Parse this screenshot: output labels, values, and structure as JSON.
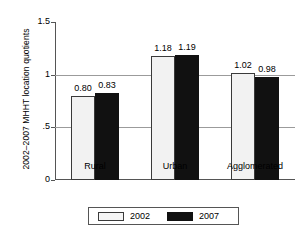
{
  "chart_data": {
    "type": "bar",
    "title": "",
    "xlabel": "",
    "ylabel": "2002–2007 MHHT  location quotients",
    "ylim": [
      0,
      1.5
    ],
    "ytick_labels": [
      "0",
      ".5",
      "1",
      "1.5"
    ],
    "ytick_values": [
      0,
      0.5,
      1,
      1.5
    ],
    "gridlines": [
      0.5,
      1
    ],
    "grid": true,
    "legend_position": "bottom",
    "categories": [
      "Rural",
      "Urban",
      "Agglomerated"
    ],
    "series": [
      {
        "name": "2002",
        "color": "#f2f2f2",
        "values": [
          0.8,
          1.18,
          1.02
        ],
        "labels": [
          "0.80",
          "1.18",
          "1.02"
        ]
      },
      {
        "name": "2007",
        "color": "#111111",
        "values": [
          0.83,
          1.19,
          0.98
        ],
        "labels": [
          "0.83",
          "1.19",
          "0.98"
        ]
      }
    ]
  },
  "legend": {
    "items": [
      {
        "label": "2002",
        "swatch": "light-swatch"
      },
      {
        "label": "2007",
        "swatch": "dark-swatch"
      }
    ]
  }
}
